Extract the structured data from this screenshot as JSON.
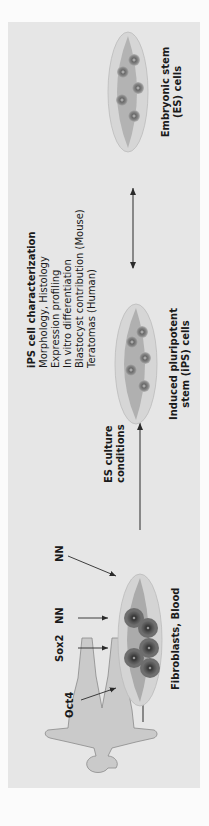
{
  "diagram": {
    "orientation": "rotated-90-ccw",
    "source": {
      "label": "Fibroblasts, Blood"
    },
    "factors": [
      "Oct4",
      "Sox2",
      "NN",
      "NN"
    ],
    "step1": {
      "label_line1": "ES culture",
      "label_line2": "conditions"
    },
    "ips": {
      "label_line1": "Induced pluripotent",
      "label_line2": "stem (iPS) cells"
    },
    "characterization": {
      "title": "iPS cell characterization",
      "items": [
        "Morphology, Histology",
        "Expression profiling",
        "In vitro differentiation",
        "Blastocyst contribution (Mouse)",
        "Teratomas (Human)"
      ]
    },
    "es": {
      "label_line1": "Embryonic stem",
      "label_line2": "(ES) cells"
    },
    "colors": {
      "panel": "#e6e6e6",
      "dish_outer": "#d0d0d0",
      "dish_inner": "#a8a8a8",
      "cell_dark": "#555555",
      "cell_ring": "#6e6e6e",
      "human": "#c8c8c8",
      "arrow": "#2a2a2a"
    }
  }
}
